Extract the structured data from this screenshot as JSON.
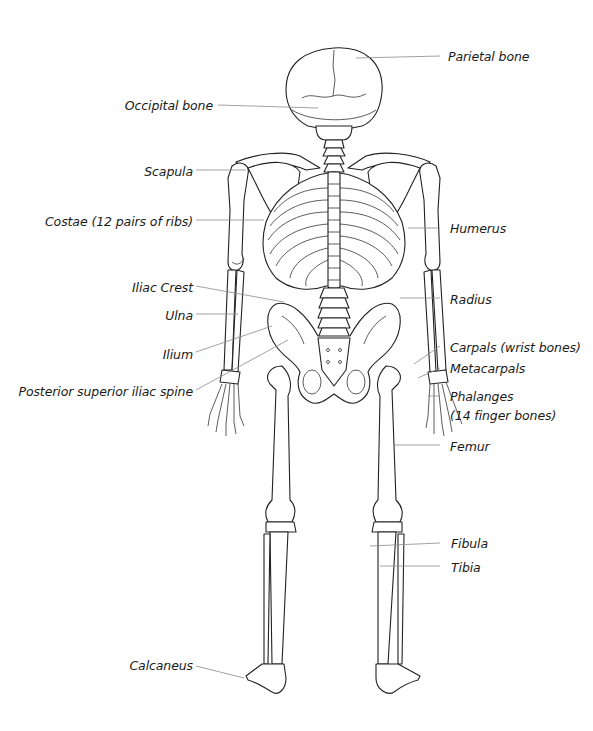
{
  "diagram": {
    "labels_left": [
      {
        "id": "occipital",
        "text": "Occipital bone",
        "x": 8,
        "y": 98,
        "w": 205
      },
      {
        "id": "scapula",
        "text": "Scapula",
        "x": 8,
        "y": 164,
        "w": 185
      },
      {
        "id": "costae",
        "text": "Costae (12 pairs of ribs)",
        "x": 8,
        "y": 214,
        "w": 185
      },
      {
        "id": "iliac_crest",
        "text": "Iliac Crest",
        "x": 8,
        "y": 280,
        "w": 185
      },
      {
        "id": "ulna",
        "text": "Ulna",
        "x": 8,
        "y": 308,
        "w": 185
      },
      {
        "id": "ilium",
        "text": "Ilium",
        "x": 8,
        "y": 348,
        "w": 185
      },
      {
        "id": "psis",
        "text": "Posterior superior iliac spine",
        "x": 8,
        "y": 385,
        "w": 185
      },
      {
        "id": "calcaneus",
        "text": "Calcaneus",
        "x": 8,
        "y": 660,
        "w": 185
      }
    ],
    "labels_right": [
      {
        "id": "parietal",
        "text": "Parietal bone",
        "x": 448,
        "y": 49
      },
      {
        "id": "humerus",
        "text": "Humerus",
        "x": 450,
        "y": 221
      },
      {
        "id": "radius",
        "text": "Radius",
        "x": 450,
        "y": 292
      },
      {
        "id": "carpals",
        "text": "Carpals (wrist bones)",
        "x": 450,
        "y": 340
      },
      {
        "id": "metacarpals",
        "text": "Metacarpals",
        "x": 450,
        "y": 361
      },
      {
        "id": "phalanges_1",
        "text": "Phalanges",
        "x": 450,
        "y": 389
      },
      {
        "id": "phalanges_2",
        "text": "(14 finger bones)",
        "x": 450,
        "y": 408
      },
      {
        "id": "femur",
        "text": "Femur",
        "x": 450,
        "y": 439
      },
      {
        "id": "fibula",
        "text": "Fibula",
        "x": 451,
        "y": 536
      },
      {
        "id": "tibia",
        "text": "Tibia",
        "x": 451,
        "y": 561
      }
    ],
    "colors": {
      "line": "#222222",
      "leader": "#8a8a8a",
      "text": "#1a1a1a",
      "background": "#ffffff"
    }
  }
}
